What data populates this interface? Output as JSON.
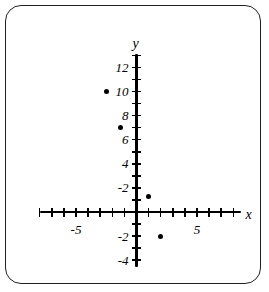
{
  "chart_data": {
    "type": "scatter",
    "title": "",
    "xlabel": "x",
    "ylabel": "y",
    "grid": false,
    "legend": false,
    "xlim": [
      -8,
      8
    ],
    "ylim": [
      -4.5,
      13
    ],
    "x_tick_labels": [
      "-5",
      "5"
    ],
    "x_tick_label_values": [
      -5,
      5
    ],
    "y_tick_labels": [
      "12",
      "10",
      "8",
      "6",
      "4",
      "-2",
      "-2",
      "-4"
    ],
    "y_tick_label_values": [
      12,
      10,
      8,
      6,
      4,
      2,
      -2,
      -4
    ],
    "x_tick_step": 1,
    "y_tick_step": 1,
    "points": [
      {
        "label": "point-1",
        "x": -2.5,
        "y": 10
      },
      {
        "label": "point-2",
        "x": -1.3,
        "y": 7
      },
      {
        "label": "point-3",
        "x": 1,
        "y": 1.3
      },
      {
        "label": "point-4",
        "x": 2,
        "y": -2
      }
    ],
    "point_color": "#000000",
    "axis_color": "#000000",
    "frame_color": "#231f20",
    "background_color": "#ffffff"
  },
  "axes": {
    "x_name": "x",
    "y_name": "y"
  }
}
